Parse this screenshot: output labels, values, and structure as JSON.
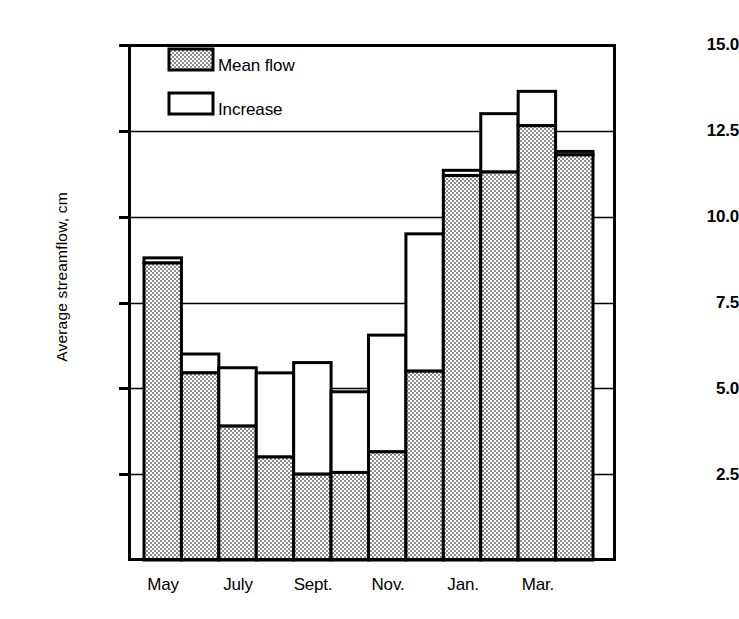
{
  "chart_data": {
    "type": "bar",
    "title": "",
    "subtitle": "",
    "xlabel": "",
    "ylabel": "Average streamflow, cm",
    "ylim": [
      0,
      15
    ],
    "yticks": [
      "2.5",
      "5.0",
      "7.5",
      "10.0",
      "12.5",
      "15.0"
    ],
    "ytick_values": [
      2.5,
      5.0,
      7.5,
      10.0,
      12.5,
      15.0
    ],
    "grid": "horizontal",
    "stacked": true,
    "legend_position": "top-left-inside",
    "legend": [
      {
        "name": "Mean flow",
        "fill": "hatched-gray"
      },
      {
        "name": "Increase",
        "fill": "white"
      }
    ],
    "categories": [
      "May",
      "June",
      "July",
      "Aug.",
      "Sept.",
      "Oct.",
      "Nov.",
      "Dec.",
      "Jan.",
      "Feb.",
      "Mar.",
      "Apr."
    ],
    "xtick_labels": [
      "May",
      "July",
      "Sept.",
      "Nov.",
      "Jan.",
      "Mar."
    ],
    "xtick_category_index": [
      0,
      2,
      4,
      6,
      8,
      10
    ],
    "series": [
      {
        "name": "Mean flow",
        "values": [
          8.65,
          5.45,
          3.9,
          3.0,
          2.5,
          2.55,
          3.15,
          5.5,
          11.2,
          11.3,
          12.65,
          11.8
        ]
      },
      {
        "name": "Increase",
        "values": [
          0.15,
          0.55,
          1.7,
          2.45,
          3.25,
          2.35,
          3.4,
          4.0,
          0.15,
          1.7,
          1.0,
          0.1
        ]
      }
    ],
    "totals": [
      8.8,
      6.0,
      5.6,
      5.45,
      5.75,
      4.9,
      6.55,
      9.5,
      11.35,
      13.0,
      13.65,
      11.9
    ],
    "colors": {
      "mean_flow_fill": "#b3b3b3",
      "increase_fill": "#ffffff",
      "bar_outline": "#000000",
      "gridline": "#000000",
      "axis": "#000000",
      "background": "#ffffff"
    }
  }
}
